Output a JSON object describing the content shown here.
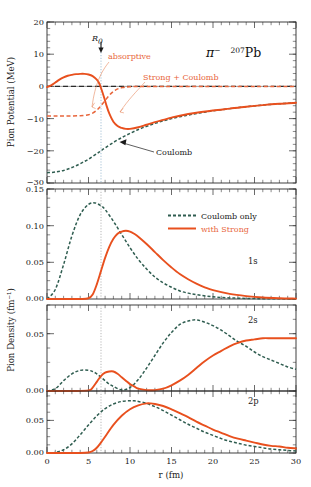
{
  "figure": {
    "title_particle": "π",
    "title_particle_sup": "−",
    "title_nucleus_sup": "207",
    "title_nucleus": "Pb",
    "xlabel": "r (fm)",
    "r0_label": "R",
    "r0_sub": "0",
    "colors": {
      "strong": "#e8501e",
      "coulomb": "#2f5d50",
      "r0_guide": "#7fa8c4",
      "text": "#1a1a1a"
    }
  },
  "panels": [
    {
      "id": "potential",
      "ylabel": "Pion Potential (MeV)",
      "ylim": [
        -30,
        20
      ],
      "yticks": [
        -30,
        -20,
        -10,
        0,
        10,
        20
      ],
      "yticklabels": [
        "",
        "−20",
        "−10",
        "0",
        "10",
        "20"
      ],
      "annotations": [
        {
          "name": "absorptive",
          "text": "absorptive",
          "color": "#e8895f"
        },
        {
          "name": "strong-plus-coulomb",
          "text": "Strong + Coulomb",
          "color": "#e8895f"
        },
        {
          "name": "coulomb",
          "text": "Coulomb",
          "color": "#1a1a1a"
        }
      ]
    },
    {
      "id": "1s",
      "state": "1s",
      "ylim": [
        0.0,
        0.15
      ],
      "yticks": [
        0.0,
        0.05,
        0.1,
        0.15
      ],
      "yticklabels": [
        "0.00",
        "0.05",
        "0.10",
        "0.15"
      ]
    },
    {
      "id": "2s",
      "state": "2s",
      "ylim": [
        0.0,
        0.075
      ],
      "yticks": [
        0.0,
        0.05
      ],
      "yticklabels": [
        "0.00",
        "0.05"
      ]
    },
    {
      "id": "2p",
      "state": "2p",
      "ylim": [
        0.0,
        0.095
      ],
      "yticks": [
        0.0,
        0.05
      ],
      "yticklabels": [
        "0.00",
        "0.05"
      ]
    }
  ],
  "density_ylabel": "Pion Density (fm⁻¹)",
  "legend": {
    "items": [
      {
        "label": "Coulomb only",
        "style": "dashed",
        "color": "#2f5d50",
        "textcolor": "#1a1a1a"
      },
      {
        "label": "with Strong",
        "style": "solid",
        "color": "#e8501e",
        "textcolor": "#e8663c"
      }
    ]
  },
  "xaxis": {
    "lim": [
      0,
      30
    ],
    "ticks": [
      0,
      5,
      10,
      15,
      20,
      25,
      30
    ],
    "ticklabels": [
      "0",
      "5",
      "10",
      "15",
      "20",
      "25",
      "30"
    ],
    "minor_step": 1
  },
  "chart_data": {
    "type": "line",
    "xlabel": "r (fm)",
    "xlim": [
      0,
      30
    ],
    "xticks": [
      0,
      5,
      10,
      15,
      20,
      25,
      30
    ],
    "grid": false,
    "R0": 6.5,
    "subplots": [
      {
        "name": "Pion Potential",
        "ylabel": "Pion Potential (MeV)",
        "ylim": [
          -30,
          20
        ],
        "yticks": [
          -30,
          -20,
          -10,
          0,
          10,
          20
        ],
        "legend_position": "inline-annotations",
        "series": [
          {
            "name": "Coulomb",
            "style": "dashed",
            "color": "#2f5d50",
            "x": [
              0,
              1,
              2,
              3,
              4,
              5,
              6,
              6.5,
              7,
              8,
              9,
              10,
              11,
              12,
              13,
              14,
              15,
              16,
              17,
              18,
              19,
              20,
              22,
              24,
              26,
              28,
              30
            ],
            "y": [
              -26.8,
              -26.6,
              -26.1,
              -25.2,
              -24.0,
              -22.6,
              -20.9,
              -20.0,
              -19.1,
              -17.4,
              -15.9,
              -14.6,
              -13.4,
              -12.4,
              -11.5,
              -10.7,
              -10.0,
              -9.4,
              -8.9,
              -8.4,
              -8.0,
              -7.6,
              -6.9,
              -6.3,
              -5.8,
              -5.4,
              -5.1
            ]
          },
          {
            "name": "Strong + Coulomb (real, total)",
            "style": "solid",
            "color": "#e8501e",
            "x": [
              0,
              0.5,
              1,
              1.5,
              2,
              2.5,
              3,
              3.5,
              4,
              4.5,
              5,
              5.5,
              6,
              6.3,
              6.6,
              6.9,
              7.2,
              7.5,
              8,
              8.5,
              9,
              9.5,
              10,
              11,
              12,
              13,
              14,
              15,
              16,
              18,
              20,
              22,
              24,
              26,
              28,
              30
            ],
            "y": [
              -0.2,
              0.3,
              1.2,
              2.1,
              2.8,
              3.3,
              3.6,
              3.8,
              3.9,
              3.9,
              3.7,
              3.2,
              2.1,
              0.9,
              -1.2,
              -3.6,
              -6.2,
              -8.4,
              -11.0,
              -12.3,
              -12.9,
              -13.2,
              -13.2,
              -12.7,
              -11.9,
              -11.1,
              -10.4,
              -9.7,
              -9.1,
              -8.2,
              -7.5,
              -6.9,
              -6.3,
              -5.8,
              -5.4,
              -5.1
            ]
          },
          {
            "name": "absorptive (imaginary part)",
            "style": "dashed",
            "color": "#e8663c",
            "x": [
              0,
              1,
              2,
              3,
              4,
              4.5,
              5,
              5.5,
              6,
              6.3,
              6.6,
              7,
              7.4,
              7.8,
              8.2,
              8.6,
              9,
              10,
              12,
              15,
              20,
              25,
              30
            ],
            "y": [
              -9.2,
              -9.2,
              -9.2,
              -9.2,
              -9.1,
              -9.0,
              -8.8,
              -8.3,
              -7.4,
              -6.6,
              -5.7,
              -4.4,
              -3.1,
              -2.0,
              -1.2,
              -0.7,
              -0.4,
              -0.1,
              0.0,
              0.0,
              0.0,
              0.0,
              0.0
            ]
          },
          {
            "name": "zero reference / Strong+Coulomb asymptote",
            "style": "dashed-black",
            "color": "#2b2b2b",
            "x": [
              0,
              30
            ],
            "y": [
              0,
              0
            ]
          }
        ]
      },
      {
        "name": "1s",
        "state": "1s",
        "ylabel": "Pion Density (fm⁻¹)",
        "ylim": [
          0,
          0.15
        ],
        "yticks": [
          0.0,
          0.05,
          0.1,
          0.15
        ],
        "series": [
          {
            "name": "Coulomb only",
            "style": "dashed",
            "color": "#2f5d50",
            "x": [
              0,
              1,
              2,
              3,
              4,
              5,
              5.8,
              6.5,
              7,
              8,
              9,
              10,
              11,
              12,
              13,
              14,
              15,
              16,
              17,
              18,
              20,
              22,
              24,
              26,
              28,
              30
            ],
            "y": [
              0.0,
              0.013,
              0.047,
              0.086,
              0.115,
              0.129,
              0.131,
              0.127,
              0.122,
              0.106,
              0.088,
              0.07,
              0.054,
              0.041,
              0.03,
              0.022,
              0.016,
              0.011,
              0.008,
              0.006,
              0.003,
              0.0015,
              0.0008,
              0.0004,
              0.0002,
              0.0001
            ]
          },
          {
            "name": "with Strong",
            "style": "solid",
            "color": "#e8501e",
            "x": [
              0,
              2,
              4,
              5,
              5.5,
              6,
              6.5,
              7,
              7.5,
              8,
              8.5,
              9,
              9.5,
              10,
              10.5,
              11,
              12,
              13,
              14,
              15,
              16,
              17,
              18,
              19,
              20,
              22,
              24,
              26,
              28,
              30
            ],
            "y": [
              0.0,
              0.0,
              0.0,
              0.001,
              0.006,
              0.02,
              0.038,
              0.056,
              0.071,
              0.082,
              0.089,
              0.092,
              0.093,
              0.092,
              0.089,
              0.085,
              0.075,
              0.064,
              0.053,
              0.043,
              0.034,
              0.027,
              0.021,
              0.016,
              0.012,
              0.007,
              0.004,
              0.002,
              0.001,
              0.0005
            ]
          }
        ]
      },
      {
        "name": "2s",
        "state": "2s",
        "ylim": [
          0,
          0.075
        ],
        "yticks": [
          0.0,
          0.05
        ],
        "series": [
          {
            "name": "Coulomb only",
            "style": "dashed",
            "color": "#2f5d50",
            "x": [
              0,
              1,
              2,
              3,
              4,
              5,
              5.5,
              6,
              6.5,
              7,
              7.5,
              8,
              9,
              10,
              11,
              12,
              13,
              14,
              15,
              16,
              17,
              18,
              19,
              20,
              21,
              22,
              23,
              24,
              25,
              26,
              27,
              28,
              29,
              30
            ],
            "y": [
              0.0,
              0.002,
              0.009,
              0.015,
              0.018,
              0.018,
              0.017,
              0.015,
              0.012,
              0.009,
              0.006,
              0.004,
              0.001,
              0.003,
              0.01,
              0.02,
              0.031,
              0.042,
              0.051,
              0.058,
              0.061,
              0.062,
              0.06,
              0.057,
              0.053,
              0.048,
              0.043,
              0.039,
              0.034,
              0.03,
              0.027,
              0.024,
              0.021,
              0.019
            ]
          },
          {
            "name": "with Strong",
            "style": "solid",
            "color": "#e8501e",
            "x": [
              0,
              3,
              5,
              5.5,
              6,
              6.5,
              7,
              7.5,
              8,
              8.5,
              9,
              9.5,
              10,
              10.5,
              11,
              12,
              13,
              14,
              15,
              16,
              17,
              18,
              19,
              20,
              21,
              22,
              23,
              24,
              25,
              26,
              27,
              28,
              29,
              30
            ],
            "y": [
              0.0,
              0.0,
              0.0005,
              0.003,
              0.008,
              0.013,
              0.016,
              0.017,
              0.017,
              0.015,
              0.012,
              0.009,
              0.006,
              0.004,
              0.002,
              0.0008,
              0.0008,
              0.002,
              0.005,
              0.009,
              0.014,
              0.02,
              0.026,
              0.031,
              0.035,
              0.039,
              0.042,
              0.044,
              0.045,
              0.046,
              0.046,
              0.046,
              0.046,
              0.046
            ]
          }
        ]
      },
      {
        "name": "2p",
        "state": "2p",
        "ylim": [
          0,
          0.095
        ],
        "yticks": [
          0.0,
          0.05
        ],
        "series": [
          {
            "name": "Coulomb only",
            "style": "dashed",
            "color": "#2f5d50",
            "x": [
              0,
              1,
              2,
              3,
              4,
              5,
              6,
              7,
              8,
              9,
              10,
              10.5,
              11,
              12,
              13,
              14,
              15,
              16,
              17,
              18,
              19,
              20,
              21,
              22,
              23,
              24,
              25,
              26,
              27,
              28,
              29,
              30
            ],
            "y": [
              0.0,
              0.001,
              0.005,
              0.014,
              0.028,
              0.043,
              0.057,
              0.068,
              0.075,
              0.079,
              0.08,
              0.08,
              0.079,
              0.076,
              0.071,
              0.065,
              0.058,
              0.051,
              0.044,
              0.038,
              0.032,
              0.027,
              0.022,
              0.018,
              0.015,
              0.012,
              0.01,
              0.008,
              0.006,
              0.005,
              0.004,
              0.003
            ]
          },
          {
            "name": "with Strong",
            "style": "solid",
            "color": "#e8501e",
            "x": [
              0,
              2,
              4,
              5,
              5.5,
              6,
              6.5,
              7,
              8,
              9,
              10,
              11,
              12,
              12.5,
              13,
              14,
              15,
              16,
              17,
              18,
              19,
              20,
              21,
              22,
              23,
              24,
              25,
              26,
              27,
              28,
              29,
              30
            ],
            "y": [
              0.0,
              0.0,
              0.0,
              0.0008,
              0.003,
              0.008,
              0.016,
              0.025,
              0.043,
              0.057,
              0.067,
              0.073,
              0.076,
              0.076,
              0.075,
              0.072,
              0.067,
              0.061,
              0.055,
              0.048,
              0.042,
              0.036,
              0.031,
              0.026,
              0.022,
              0.019,
              0.016,
              0.013,
              0.011,
              0.01,
              0.008,
              0.007
            ]
          }
        ]
      }
    ]
  }
}
